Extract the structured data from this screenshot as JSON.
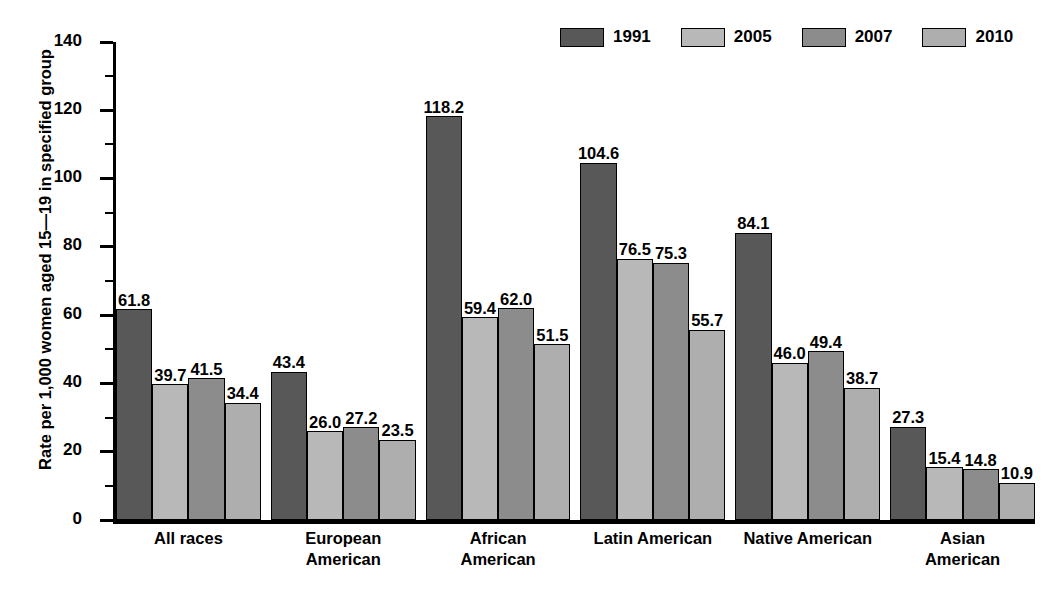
{
  "chart_data": {
    "type": "bar",
    "title": "",
    "xlabel": "",
    "ylabel": "Rate per 1,000 women aged 15—19 in specified group",
    "ylim": [
      0,
      140
    ],
    "ytick_step": 20,
    "yticks": [
      0,
      20,
      40,
      60,
      80,
      100,
      120,
      140
    ],
    "minor_tick_step": 10,
    "grid": false,
    "legend_position": "top-right",
    "categories": [
      "All races",
      "European American",
      "African American",
      "Latin American",
      "Native American",
      "Asian American"
    ],
    "category_lines": [
      [
        "All races"
      ],
      [
        "European",
        "American"
      ],
      [
        "African",
        "American"
      ],
      [
        "Latin American"
      ],
      [
        "Native American"
      ],
      [
        "Asian",
        "American"
      ]
    ],
    "series": [
      {
        "name": "1991",
        "color": "#585858",
        "values": [
          61.8,
          43.4,
          118.2,
          104.6,
          84.1,
          27.3
        ],
        "labels": [
          "61.8",
          "43.4",
          "118.2",
          "104.6",
          "84.1",
          "27.3"
        ]
      },
      {
        "name": "2005",
        "color": "#b8b8b8",
        "values": [
          39.7,
          26.0,
          59.4,
          76.5,
          46.0,
          15.4
        ],
        "labels": [
          "39.7",
          "26.0",
          "59.4",
          "76.5",
          "46.0",
          "15.4"
        ]
      },
      {
        "name": "2007",
        "color": "#8c8c8c",
        "values": [
          41.5,
          27.2,
          62.0,
          75.3,
          49.4,
          14.8
        ],
        "labels": [
          "41.5",
          "27.2",
          "62.0",
          "75.3",
          "49.4",
          "14.8"
        ]
      },
      {
        "name": "2010",
        "color": "#aeaeae",
        "values": [
          34.4,
          23.5,
          51.5,
          55.7,
          38.7,
          10.9
        ],
        "labels": [
          "34.4",
          "23.5",
          "51.5",
          "55.7",
          "38.7",
          "10.9"
        ]
      }
    ]
  },
  "legend": {
    "entries": [
      {
        "label": "1991",
        "color": "#585858"
      },
      {
        "label": "2005",
        "color": "#b8b8b8"
      },
      {
        "label": "2007",
        "color": "#8c8c8c"
      },
      {
        "label": "2010",
        "color": "#aeaeae"
      }
    ]
  }
}
